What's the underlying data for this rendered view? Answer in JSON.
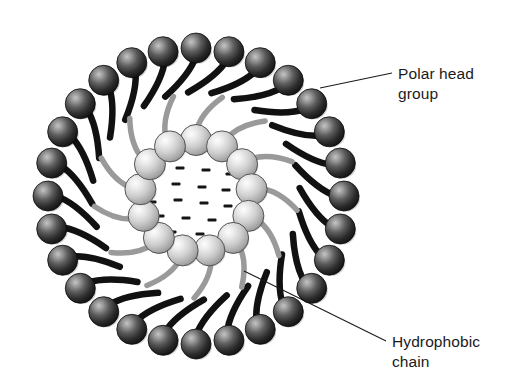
{
  "figure": {
    "background_color": "#ffffff",
    "canvas": {
      "width": 512,
      "height": 390
    },
    "center": {
      "x": 196,
      "y": 196
    }
  },
  "annotations": [
    {
      "name": "polar-head-group",
      "line1": "Polar head",
      "line2": "group",
      "text_x": 398,
      "text_y": 79,
      "line_from": {
        "x": 320,
        "y": 88
      },
      "line_to": {
        "x": 392,
        "y": 73
      },
      "color": "#1b1b1b"
    },
    {
      "name": "hydrophobic-chain",
      "line1": "Hydrophobic",
      "line2": "chain",
      "text_x": 392,
      "text_y": 347,
      "line_from": {
        "x": 244,
        "y": 271
      },
      "line_to": {
        "x": 386,
        "y": 341
      },
      "color": "#1b1b1b"
    }
  ],
  "outer_layer": {
    "name": "outer-phospholipid-ring",
    "count": 28,
    "ring_radius": 148,
    "head_radius": 15,
    "head_highlight_color": "#b8b8b8",
    "head_mid_color": "#5a5a5a",
    "head_edge_color": "#141414",
    "tail_color": "#111111",
    "tail_width": 6.5,
    "tail_length": 44,
    "start_angle_deg": -90
  },
  "inner_layer": {
    "name": "inner-phospholipid-ring",
    "count": 13,
    "ring_radius": 56,
    "head_radius": 15.5,
    "head_highlight_color": "#fbfbfb",
    "head_mid_color": "#d2d2d2",
    "head_edge_color": "#8d8d8d",
    "head_stroke_color": "#555555",
    "tail_color": "#9a9a9a",
    "tail_width": 5.5,
    "tail_length": 46,
    "start_angle_deg": -90
  },
  "aqueous_core": {
    "name": "aqueous-core-dashes",
    "dash_color": "#151515",
    "dash_width": 9,
    "dash_height": 3.2,
    "dashes": [
      {
        "x": -30,
        "y": -40
      },
      {
        "x": -4,
        "y": -45
      },
      {
        "x": 22,
        "y": -39
      },
      {
        "x": -42,
        "y": -25
      },
      {
        "x": -16,
        "y": -28
      },
      {
        "x": 10,
        "y": -26
      },
      {
        "x": 34,
        "y": -22
      },
      {
        "x": -46,
        "y": -10
      },
      {
        "x": -20,
        "y": -12
      },
      {
        "x": 6,
        "y": -9
      },
      {
        "x": 30,
        "y": -6
      },
      {
        "x": -44,
        "y": 6
      },
      {
        "x": -18,
        "y": 4
      },
      {
        "x": 8,
        "y": 7
      },
      {
        "x": 32,
        "y": 10
      },
      {
        "x": -36,
        "y": 20
      },
      {
        "x": -10,
        "y": 22
      },
      {
        "x": 16,
        "y": 24
      },
      {
        "x": -24,
        "y": 36
      },
      {
        "x": 4,
        "y": 38
      }
    ]
  }
}
